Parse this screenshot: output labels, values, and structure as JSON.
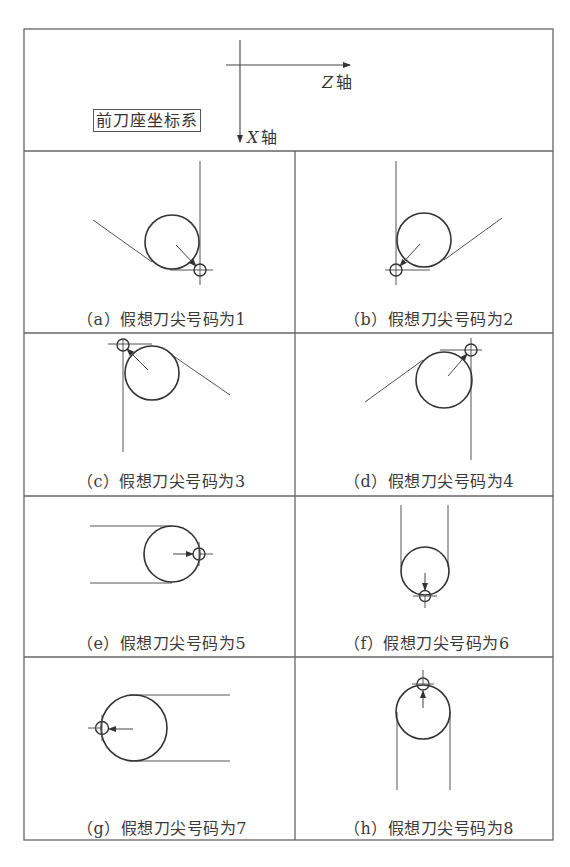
{
  "figure": {
    "type": "imaginary-tool-tip-number-table",
    "header": {
      "system_label": "前刀座坐标系",
      "z_axis_letter": "Z",
      "z_axis_suffix": "轴",
      "x_axis_letter": "X",
      "x_axis_suffix": "轴"
    },
    "cells": [
      {
        "id": "a",
        "caption": "（a）假想刀尖号码为1",
        "tip_number": 1
      },
      {
        "id": "b",
        "caption": "（b）假想刀尖号码为2",
        "tip_number": 2
      },
      {
        "id": "c",
        "caption": "（c）假想刀尖号码为3",
        "tip_number": 3
      },
      {
        "id": "d",
        "caption": "（d）假想刀尖号码为4",
        "tip_number": 4
      },
      {
        "id": "e",
        "caption": "（e）假想刀尖号码为5",
        "tip_number": 5
      },
      {
        "id": "f",
        "caption": "（f）假想刀尖号码为6",
        "tip_number": 6
      },
      {
        "id": "g",
        "caption": "（g）假想刀尖号码为7",
        "tip_number": 7
      },
      {
        "id": "h",
        "caption": "（h）假想刀尖号码为8",
        "tip_number": 8
      }
    ],
    "colors": {
      "line": "#555555",
      "circle": "#333333",
      "text": "#3a3a3a",
      "background": "#ffffff"
    }
  }
}
